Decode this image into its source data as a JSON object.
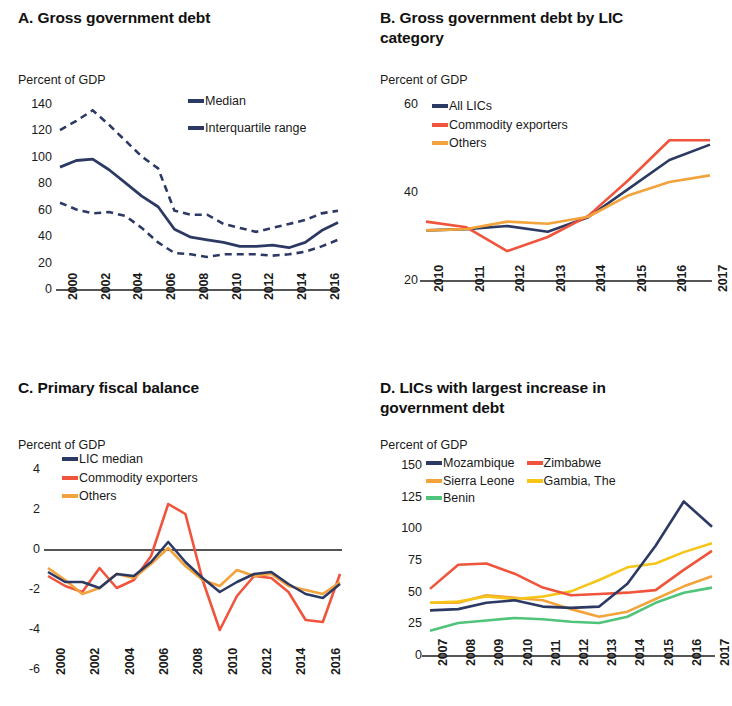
{
  "colors": {
    "navy": "#2c3a63",
    "red": "#f0543c",
    "orange": "#f2a33c",
    "yellow": "#f5c518",
    "green": "#4fc47a",
    "axis": "#555555"
  },
  "panels": {
    "a": {
      "letter_title": "A. Gross government debt",
      "axis_unit": "Percent of GDP",
      "legend": [
        {
          "label": "Median",
          "color": "#2c3a63",
          "style": "solid"
        },
        {
          "label": "Interquartile range",
          "color": "#2c3a63",
          "style": "dashed"
        }
      ]
    },
    "b": {
      "letter_title": "B. Gross government debt by LIC category",
      "axis_unit": "Percent of GDP",
      "legend": [
        {
          "label": "All LICs",
          "color": "#2c3a63",
          "style": "solid"
        },
        {
          "label": "Commodity exporters",
          "color": "#f0543c",
          "style": "solid"
        },
        {
          "label": "Others",
          "color": "#f2a33c",
          "style": "solid"
        }
      ]
    },
    "c": {
      "letter_title": "C. Primary fiscal balance",
      "axis_unit": "Percent of GDP",
      "legend": [
        {
          "label": "LIC median",
          "color": "#2c3a63",
          "style": "solid"
        },
        {
          "label": "Commodity exporters",
          "color": "#f0543c",
          "style": "solid"
        },
        {
          "label": "Others",
          "color": "#f2a33c",
          "style": "solid"
        }
      ]
    },
    "d": {
      "letter_title": "D. LICs with largest increase in government debt",
      "axis_unit": "Percent of GDP",
      "legend": [
        {
          "label": "Mozambique",
          "color": "#2c3a63",
          "style": "solid"
        },
        {
          "label": "Zimbabwe",
          "color": "#f0543c",
          "style": "solid"
        },
        {
          "label": "Sierra Leone",
          "color": "#f2a33c",
          "style": "solid"
        },
        {
          "label": "Gambia, The",
          "color": "#f5c518",
          "style": "solid"
        },
        {
          "label": "Benin",
          "color": "#4fc47a",
          "style": "solid"
        }
      ]
    }
  },
  "chart_data": [
    {
      "panel": "A",
      "type": "line",
      "title": "A. Gross government debt",
      "ylabel": "Percent of GDP",
      "xlabel": "",
      "ylim": [
        0,
        140
      ],
      "yticks": [
        0,
        20,
        40,
        60,
        80,
        100,
        120,
        140
      ],
      "x": [
        2000,
        2001,
        2002,
        2003,
        2004,
        2005,
        2006,
        2007,
        2008,
        2009,
        2010,
        2011,
        2012,
        2013,
        2014,
        2015,
        2016,
        2017
      ],
      "xticks": [
        2000,
        2002,
        2004,
        2006,
        2008,
        2010,
        2012,
        2014,
        2016
      ],
      "grid": false,
      "legend_position": "upper-right",
      "series": [
        {
          "name": "Median",
          "style": "solid",
          "color": "#2c3a63",
          "values": [
            93,
            98,
            99,
            91,
            81,
            71,
            63,
            46,
            40,
            38,
            36,
            33,
            33,
            34,
            32,
            36,
            45,
            51
          ]
        },
        {
          "name": "Interquartile range (upper)",
          "style": "dashed",
          "color": "#2c3a63",
          "values": [
            121,
            128,
            136,
            125,
            113,
            101,
            92,
            60,
            57,
            57,
            50,
            47,
            44,
            47,
            50,
            53,
            58,
            60
          ]
        },
        {
          "name": "Interquartile range (lower)",
          "style": "dashed",
          "color": "#2c3a63",
          "values": [
            66,
            61,
            58,
            59,
            56,
            47,
            36,
            28,
            27,
            25,
            27,
            27,
            27,
            26,
            27,
            29,
            33,
            38
          ]
        }
      ]
    },
    {
      "panel": "B",
      "type": "line",
      "title": "B. Gross government debt by LIC category",
      "ylabel": "Percent of GDP",
      "xlabel": "",
      "ylim": [
        20,
        60
      ],
      "yticks": [
        20,
        40,
        60
      ],
      "x": [
        2010,
        2011,
        2012,
        2013,
        2014,
        2015,
        2016,
        2017
      ],
      "xticks": [
        2010,
        2011,
        2012,
        2013,
        2014,
        2015,
        2016,
        2017
      ],
      "grid": false,
      "legend_position": "upper-left",
      "series": [
        {
          "name": "All LICs",
          "color": "#2c3a63",
          "style": "solid",
          "values": [
            31.5,
            31.8,
            32.5,
            31.2,
            34.5,
            41,
            47.5,
            51
          ]
        },
        {
          "name": "Commodity exporters",
          "color": "#f0543c",
          "style": "solid",
          "values": [
            33.5,
            32.2,
            26.8,
            30.0,
            34.8,
            43,
            52,
            52
          ]
        },
        {
          "name": "Others",
          "color": "#f2a33c",
          "style": "solid",
          "values": [
            31.5,
            31.8,
            33.5,
            33.0,
            34.6,
            39.5,
            42.5,
            44
          ]
        }
      ]
    },
    {
      "panel": "C",
      "type": "line",
      "title": "C. Primary fiscal balance",
      "ylabel": "Percent of GDP",
      "xlabel": "",
      "ylim": [
        -6,
        4
      ],
      "yticks": [
        -6,
        -4,
        -2,
        0,
        2,
        4
      ],
      "x": [
        2000,
        2001,
        2002,
        2003,
        2004,
        2005,
        2006,
        2007,
        2008,
        2009,
        2010,
        2011,
        2012,
        2013,
        2014,
        2015,
        2016,
        2017
      ],
      "xticks": [
        2000,
        2002,
        2004,
        2006,
        2008,
        2010,
        2012,
        2014,
        2016
      ],
      "grid": false,
      "zero_line": true,
      "legend_position": "upper-left",
      "series": [
        {
          "name": "LIC median",
          "color": "#2c3a63",
          "style": "solid",
          "values": [
            -1.1,
            -1.6,
            -1.6,
            -1.9,
            -1.2,
            -1.3,
            -0.6,
            0.4,
            -0.6,
            -1.4,
            -2.1,
            -1.6,
            -1.2,
            -1.1,
            -1.7,
            -2.2,
            -2.4,
            -1.7
          ]
        },
        {
          "name": "Commodity exporters",
          "color": "#f0543c",
          "style": "solid",
          "values": [
            -1.3,
            -1.8,
            -2.1,
            -0.9,
            -1.9,
            -1.5,
            -0.3,
            2.3,
            1.8,
            -1.5,
            -4.0,
            -2.3,
            -1.3,
            -1.4,
            -2.1,
            -3.5,
            -3.6,
            -1.2
          ]
        },
        {
          "name": "Others",
          "color": "#f2a33c",
          "style": "solid",
          "values": [
            -0.9,
            -1.5,
            -2.2,
            -1.9,
            -1.2,
            -1.4,
            -0.7,
            0.1,
            -0.8,
            -1.5,
            -1.8,
            -1.0,
            -1.3,
            -1.2,
            -1.8,
            -2.0,
            -2.2,
            -1.6
          ]
        }
      ]
    },
    {
      "panel": "D",
      "type": "line",
      "title": "D. LICs with largest increase in government debt",
      "ylabel": "Percent of GDP",
      "xlabel": "",
      "ylim": [
        0,
        150
      ],
      "yticks": [
        0,
        25,
        50,
        75,
        100,
        125,
        150
      ],
      "x": [
        2007,
        2008,
        2009,
        2010,
        2011,
        2012,
        2013,
        2014,
        2015,
        2016,
        2017
      ],
      "xticks": [
        2007,
        2008,
        2009,
        2010,
        2011,
        2012,
        2013,
        2014,
        2015,
        2016,
        2017
      ],
      "grid": false,
      "legend_position": "upper-left",
      "series": [
        {
          "name": "Mozambique",
          "color": "#2c3a63",
          "style": "solid",
          "values": [
            36,
            37,
            42,
            44,
            39,
            38,
            39,
            57,
            87,
            122,
            102
          ]
        },
        {
          "name": "Zimbabwe",
          "color": "#f0543c",
          "style": "solid",
          "values": [
            53,
            72,
            73,
            65,
            54,
            48,
            49,
            50,
            52,
            68,
            83
          ]
        },
        {
          "name": "Sierra Leone",
          "color": "#f2a33c",
          "style": "solid",
          "values": [
            42,
            42,
            48,
            46,
            44,
            37,
            31,
            35,
            45,
            55,
            63
          ]
        },
        {
          "name": "Gambia, The",
          "color": "#f5c518",
          "style": "solid",
          "values": [
            42,
            43,
            47,
            45,
            47,
            51,
            60,
            70,
            73,
            82,
            89
          ]
        },
        {
          "name": "Benin",
          "color": "#4fc47a",
          "style": "solid",
          "values": [
            20,
            26,
            28,
            30,
            29,
            27,
            26,
            31,
            42,
            50,
            54
          ]
        }
      ]
    }
  ]
}
